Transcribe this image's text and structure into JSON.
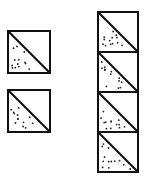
{
  "figure": {
    "stroke_color": "#111111",
    "fill_color": "#ffffff",
    "dot_color": "#222222",
    "left_blocks": [
      {
        "x": 8,
        "y": 31,
        "size": 42
      },
      {
        "x": 8,
        "y": 90,
        "size": 42
      }
    ],
    "right_strip": {
      "x": 98,
      "y": 12,
      "size": 40,
      "count": 4
    }
  }
}
